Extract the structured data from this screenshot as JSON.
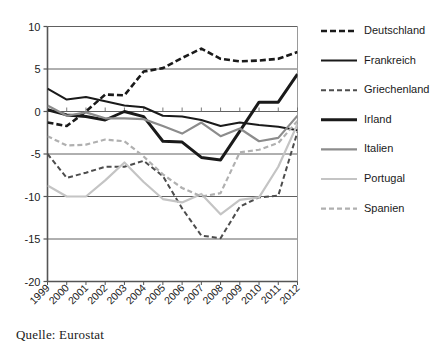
{
  "source_note": "Quelle: Eurostat",
  "legend": {
    "position": "right",
    "entries": [
      {
        "label": "Deutschland",
        "color": "#1a1a1a",
        "width": 2.6,
        "dash": "6,3"
      },
      {
        "label": "Frankreich",
        "color": "#1a1a1a",
        "width": 2.0,
        "dash": ""
      },
      {
        "label": "Griechenland",
        "color": "#4d4d4d",
        "width": 2.0,
        "dash": "5,3"
      },
      {
        "label": "Irland",
        "color": "#1a1a1a",
        "width": 3.0,
        "dash": ""
      },
      {
        "label": "Italien",
        "color": "#8c8c8c",
        "width": 2.2,
        "dash": ""
      },
      {
        "label": "Portugal",
        "color": "#c4c4c4",
        "width": 2.2,
        "dash": ""
      },
      {
        "label": "Spanien",
        "color": "#b0b0b0",
        "width": 2.2,
        "dash": "5,3"
      }
    ]
  },
  "axis": {
    "y_ticks": [
      "10",
      "5",
      "0",
      "-5",
      "-10",
      "-15",
      "-20"
    ],
    "x_ticks": [
      "1999",
      "2000",
      "2001",
      "2002",
      "2003",
      "2004",
      "2005",
      "2006",
      "2007",
      "2008",
      "2009",
      "2010",
      "2011",
      "2012"
    ]
  },
  "chart_data": {
    "type": "line",
    "title": "",
    "subtitle": "",
    "xlabel": "",
    "ylabel": "",
    "ylim": [
      -20,
      10
    ],
    "ytick_step": 5,
    "grid": true,
    "legend_position": "right",
    "annotation": "Quelle: Eurostat",
    "categories": [
      "1999",
      "2000",
      "2001",
      "2002",
      "2003",
      "2004",
      "2005",
      "2006",
      "2007",
      "2008",
      "2009",
      "2010",
      "2011",
      "2012"
    ],
    "x": [
      1999,
      2000,
      2001,
      2002,
      2003,
      2004,
      2005,
      2006,
      2007,
      2008,
      2009,
      2010,
      2011,
      2012
    ],
    "series": [
      {
        "name": "Deutschland",
        "color": "#1a1a1a",
        "style": "dashed",
        "values": [
          -1.3,
          -1.7,
          0.0,
          2.0,
          1.9,
          4.7,
          5.1,
          6.3,
          7.4,
          6.2,
          5.9,
          6.0,
          6.2,
          7.0
        ]
      },
      {
        "name": "Frankreich",
        "color": "#1a1a1a",
        "style": "solid",
        "values": [
          2.7,
          1.4,
          1.7,
          1.2,
          0.7,
          0.5,
          -0.5,
          -0.6,
          -1.0,
          -1.7,
          -1.3,
          -1.6,
          -1.8,
          -2.2
        ]
      },
      {
        "name": "Griechenland",
        "color": "#4d4d4d",
        "style": "dashed",
        "values": [
          -5.0,
          -7.8,
          -7.2,
          -6.5,
          -6.5,
          -5.8,
          -7.6,
          -11.4,
          -14.6,
          -14.9,
          -11.2,
          -10.1,
          -9.9,
          -2.4
        ]
      },
      {
        "name": "Irland",
        "color": "#1a1a1a",
        "style": "solid",
        "values": [
          0.2,
          -0.4,
          -0.6,
          -1.0,
          0.0,
          -0.6,
          -3.5,
          -3.6,
          -5.4,
          -5.7,
          -2.3,
          1.1,
          1.1,
          4.4
        ]
      },
      {
        "name": "Italien",
        "color": "#8c8c8c",
        "style": "solid",
        "values": [
          0.7,
          -0.5,
          -0.1,
          -0.8,
          -0.8,
          -0.9,
          -1.7,
          -2.6,
          -1.3,
          -2.9,
          -2.0,
          -3.5,
          -3.1,
          -0.5
        ]
      },
      {
        "name": "Portugal",
        "color": "#c4c4c4",
        "style": "solid",
        "values": [
          -8.7,
          -10.0,
          -10.0,
          -8.1,
          -6.0,
          -8.3,
          -10.3,
          -10.7,
          -9.7,
          -12.1,
          -10.4,
          -10.1,
          -6.5,
          -1.5
        ]
      },
      {
        "name": "Spanien",
        "color": "#b0b0b0",
        "style": "dashed",
        "values": [
          -2.9,
          -4.0,
          -3.9,
          -3.3,
          -3.5,
          -5.3,
          -7.4,
          -9.0,
          -10.0,
          -9.6,
          -4.8,
          -4.5,
          -3.7,
          -1.1
        ]
      }
    ]
  }
}
